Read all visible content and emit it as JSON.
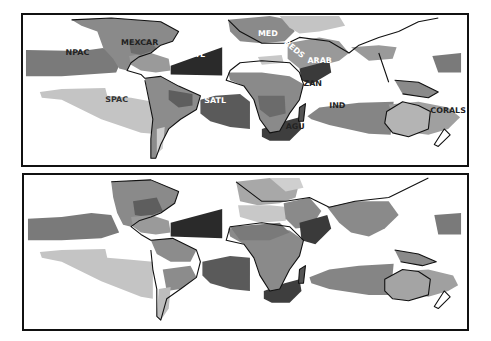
{
  "figure": {
    "panels": [
      {
        "id": "top",
        "labels": [
          {
            "text": "NPAC",
            "x": 64,
            "y": 51
          },
          {
            "text": "MEXCAR",
            "x": 127,
            "y": 41
          },
          {
            "text": "NATL",
            "x": 189,
            "y": 53
          },
          {
            "text": "SPAC",
            "x": 114,
            "y": 99
          },
          {
            "text": "SATL",
            "x": 211,
            "y": 100
          },
          {
            "text": "MED",
            "x": 265,
            "y": 32
          },
          {
            "text": "REDS",
            "x": 289,
            "y": 45
          },
          {
            "text": "ARAB",
            "x": 308,
            "y": 59
          },
          {
            "text": "ZAN",
            "x": 310,
            "y": 83
          },
          {
            "text": "IND",
            "x": 333,
            "y": 106
          },
          {
            "text": "AGU",
            "x": 290,
            "y": 126
          },
          {
            "text": "CORALS",
            "x": 435,
            "y": 111
          }
        ]
      },
      {
        "id": "bottom",
        "labels": []
      }
    ],
    "colors": {
      "darkest": "#2a2a2a",
      "dark": "#555555",
      "mid": "#7a7a7a",
      "light": "#9c9c9c",
      "lighter": "#bdbdbd",
      "lightest": "#d3d3d3",
      "coast": "#111111",
      "background": "#ffffff"
    }
  }
}
